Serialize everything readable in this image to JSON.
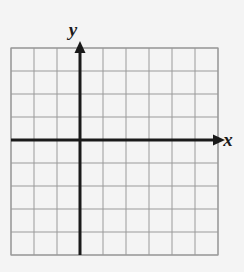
{
  "figure": {
    "name": "coordinate-plane",
    "background_color": "#f4f4f4",
    "grid": {
      "line_color": "#9a9a9a",
      "minor_line_color": "#b8b8b8",
      "columns": 9,
      "rows": 9,
      "cell_size": 23,
      "left": 11,
      "top": 48,
      "right": 218,
      "bottom": 255
    },
    "axes": {
      "color": "#1a1a1a",
      "stroke_width": 3,
      "origin_x": 80,
      "origin_y": 140,
      "x_axis": {
        "label": "x",
        "label_x": 228,
        "label_y": 140,
        "start_x": 11,
        "end_x": 216,
        "arrow": "right"
      },
      "y_axis": {
        "label": "y",
        "label_x": 73,
        "label_y": 30,
        "start_y": 255,
        "end_y": 50,
        "arrow": "up"
      }
    }
  }
}
